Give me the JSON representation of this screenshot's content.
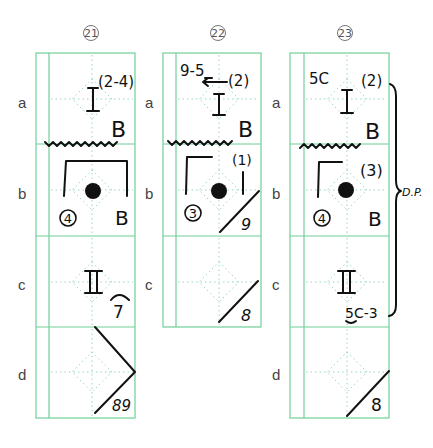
{
  "columns": [
    {
      "id": "21",
      "header": "21",
      "rows": [
        "a",
        "b",
        "c",
        "d"
      ]
    },
    {
      "id": "22",
      "header": "22",
      "rows": [
        "a",
        "b",
        "c"
      ]
    },
    {
      "id": "23",
      "header": "23",
      "rows": [
        "a",
        "b",
        "c",
        "d"
      ]
    }
  ],
  "row_labels": [
    "a",
    "b",
    "c",
    "d"
  ],
  "cells": {
    "c21a": {
      "roman": "I",
      "sup": "(2-4)",
      "corner": "B"
    },
    "c21b": {
      "circled": "4",
      "corner": "B"
    },
    "c21c": {
      "roman": "II",
      "note": "7"
    },
    "c21d": {
      "note": "89"
    },
    "c22a": {
      "top_left": "9-5",
      "note": "(2)",
      "roman": "I",
      "corner": "B"
    },
    "c22b": {
      "circled": "3",
      "note": "(1)",
      "corner": "9"
    },
    "c22c": {
      "corner": "8"
    },
    "c23a": {
      "top_left": "5C",
      "note": "(2)",
      "roman": "I",
      "corner": "B"
    },
    "c23b": {
      "circled": "4",
      "note": "(3)",
      "corner": "B"
    },
    "c23c": {
      "roman": "II",
      "note": "5C-3"
    },
    "c23d": {
      "corner": "8"
    }
  },
  "brace_label": "D.P.",
  "colors": {
    "grid": "#6fcf97",
    "ink": "#111111"
  }
}
